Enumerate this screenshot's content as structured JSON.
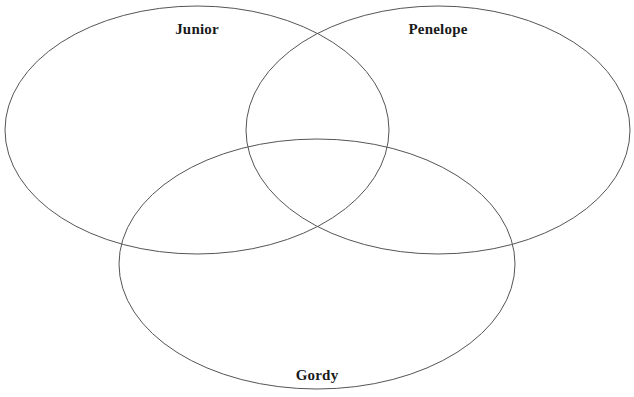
{
  "diagram": {
    "type": "venn-3-set",
    "background_color": "#ffffff",
    "stroke_color": "#555555",
    "stroke_width": 1,
    "label_color": "#1a1a1a",
    "sets": [
      {
        "id": "junior",
        "label": "Junior",
        "position": "top-left",
        "cx": 197,
        "cy": 130,
        "rx": 192,
        "ry": 124,
        "label_x": 197,
        "label_y": 22
      },
      {
        "id": "penelope",
        "label": "Penelope",
        "position": "top-right",
        "cx": 438,
        "cy": 130,
        "rx": 192,
        "ry": 124,
        "label_x": 438,
        "label_y": 22
      },
      {
        "id": "gordy",
        "label": "Gordy",
        "position": "bottom-center",
        "cx": 317,
        "cy": 264,
        "rx": 198,
        "ry": 125,
        "label_x": 317,
        "label_y": 368
      }
    ]
  },
  "chart_data": {
    "type": "venn",
    "title": "",
    "xlabel": "",
    "ylabel": "",
    "sets": [
      "Junior",
      "Penelope",
      "Gordy"
    ],
    "regions": [
      {
        "id": "junior-only",
        "sets": [
          "Junior"
        ],
        "entries": []
      },
      {
        "id": "penelope-only",
        "sets": [
          "Penelope"
        ],
        "entries": []
      },
      {
        "id": "gordy-only",
        "sets": [
          "Gordy"
        ],
        "entries": []
      },
      {
        "id": "junior-penelope",
        "sets": [
          "Junior",
          "Penelope"
        ],
        "entries": []
      },
      {
        "id": "junior-gordy",
        "sets": [
          "Junior",
          "Gordy"
        ],
        "entries": []
      },
      {
        "id": "penelope-gordy",
        "sets": [
          "Penelope",
          "Gordy"
        ],
        "entries": []
      },
      {
        "id": "junior-penelope-gordy",
        "sets": [
          "Junior",
          "Penelope",
          "Gordy"
        ],
        "entries": []
      }
    ],
    "legend_position": "none",
    "grid": false
  }
}
